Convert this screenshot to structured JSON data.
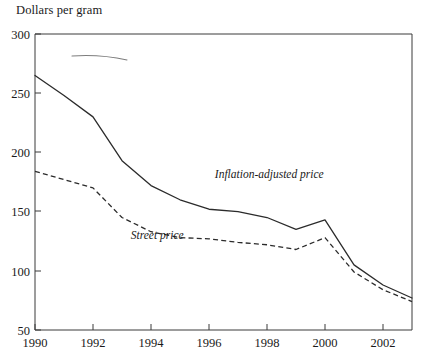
{
  "chart_data": {
    "type": "line",
    "title": "Dollars per gram",
    "xlabel": "",
    "ylabel": "Dollars per gram",
    "grid": false,
    "legend_position": "inline-annotation",
    "xlim": [
      1990,
      2003
    ],
    "ylim": [
      50,
      300
    ],
    "yticks": [
      50,
      100,
      150,
      200,
      250,
      300
    ],
    "ytick_labels": [
      "50",
      "100",
      "150",
      "200",
      "250",
      "300"
    ],
    "xticks": [
      1990,
      1992,
      1994,
      1996,
      1998,
      2000,
      2002
    ],
    "xtick_labels": [
      "1990",
      "1992",
      "1994",
      "1996",
      "1998",
      "2000",
      "2002"
    ],
    "x": [
      1990,
      1991,
      1992,
      1993,
      1994,
      1995,
      1996,
      1997,
      1998,
      1999,
      2000,
      2001,
      2002,
      2003
    ],
    "series": [
      {
        "name": "Inflation-adjusted price",
        "style": "solid",
        "color": "#2b2b2b",
        "values": [
          265,
          248,
          230,
          193,
          172,
          160,
          152,
          150,
          145,
          135,
          143,
          105,
          88,
          77
        ],
        "annotation": "Inflation-adjusted price"
      },
      {
        "name": "Street price",
        "style": "dashed",
        "color": "#2b2b2b",
        "values": [
          184,
          177,
          170,
          145,
          133,
          128,
          127,
          124,
          122,
          118,
          128,
          99,
          84,
          74
        ],
        "annotation": "Street price"
      }
    ],
    "annotations": [
      {
        "text": "Inflation-adjusted price",
        "x": 1996.2,
        "y": 178
      },
      {
        "text": "Street price",
        "x": 1993.3,
        "y": 127
      }
    ]
  }
}
